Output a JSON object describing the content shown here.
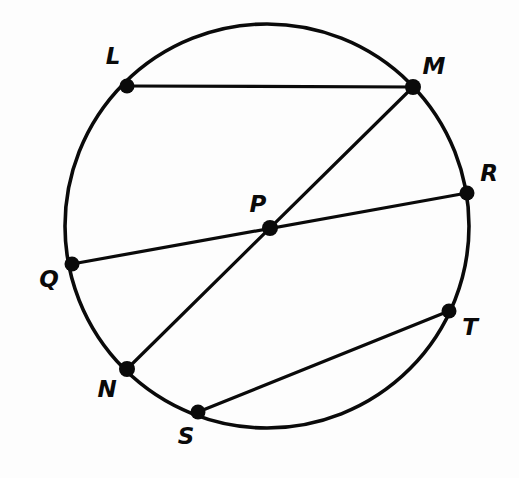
{
  "figure": {
    "name": "circle-with-chords",
    "background_color": "#fdfdfd",
    "stroke_color": "#0a0a0a",
    "circle": {
      "center_label": "P",
      "cx": 267,
      "cy": 226,
      "r": 202,
      "stroke_width": 3.6
    },
    "points": [
      {
        "label": "L",
        "x": 127,
        "y": 86,
        "label_x": 113,
        "label_y": 57,
        "dot_r": 7.5,
        "on_circle": true
      },
      {
        "label": "M",
        "x": 413,
        "y": 87,
        "label_x": 434,
        "label_y": 67,
        "dot_r": 8.0,
        "on_circle": true
      },
      {
        "label": "R",
        "x": 467,
        "y": 193,
        "label_x": 489,
        "label_y": 174,
        "dot_r": 7.5,
        "on_circle": true
      },
      {
        "label": "T",
        "x": 449,
        "y": 311,
        "label_x": 470,
        "label_y": 328,
        "dot_r": 7.5,
        "on_circle": true
      },
      {
        "label": "S",
        "x": 198,
        "y": 412,
        "label_x": 186,
        "label_y": 437,
        "dot_r": 7.5,
        "on_circle": true
      },
      {
        "label": "N",
        "x": 127,
        "y": 369,
        "label_x": 107,
        "label_y": 390,
        "dot_r": 8.0,
        "on_circle": true
      },
      {
        "label": "Q",
        "x": 72,
        "y": 264,
        "label_x": 49,
        "label_y": 280,
        "dot_r": 7.5,
        "on_circle": true
      },
      {
        "label": "P",
        "x": 270,
        "y": 228,
        "label_x": 258,
        "label_y": 205,
        "dot_r": 8.0,
        "on_circle": false
      }
    ],
    "chords": [
      {
        "name": "chord-LM",
        "from": "L",
        "to": "M",
        "x1": 127,
        "y1": 86,
        "x2": 413,
        "y2": 87
      },
      {
        "name": "chord-QR",
        "from": "Q",
        "to": "R",
        "x1": 72,
        "y1": 264,
        "x2": 467,
        "y2": 193
      },
      {
        "name": "chord-NM",
        "from": "N",
        "to": "M",
        "x1": 127,
        "y1": 369,
        "x2": 413,
        "y2": 87
      },
      {
        "name": "chord-ST",
        "from": "S",
        "to": "T",
        "x1": 198,
        "y1": 412,
        "x2": 449,
        "y2": 311
      }
    ]
  },
  "chart_data": {
    "type": "diagram",
    "title": "",
    "shape": "circle",
    "center": {
      "label": "P",
      "x": 270,
      "y": 228
    },
    "radius": 202,
    "points_on_circle": [
      "L",
      "M",
      "R",
      "T",
      "S",
      "N",
      "Q"
    ],
    "segments": [
      {
        "endpoints": [
          "L",
          "M"
        ],
        "through_center": false
      },
      {
        "endpoints": [
          "Q",
          "R"
        ],
        "through_center": true
      },
      {
        "endpoints": [
          "N",
          "M"
        ],
        "through_center": true
      },
      {
        "endpoints": [
          "S",
          "T"
        ],
        "through_center": false
      }
    ],
    "diameters": [
      "QR",
      "NM"
    ],
    "chords_not_diameter": [
      "LM",
      "ST"
    ]
  }
}
